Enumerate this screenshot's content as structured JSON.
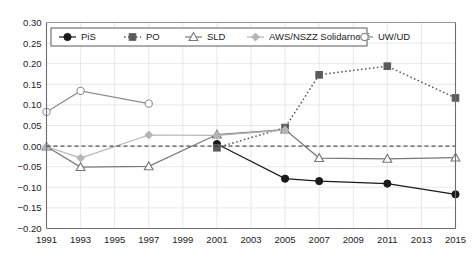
{
  "chart_data": {
    "type": "line",
    "title": "",
    "subtitle": "",
    "xlabel": "",
    "ylabel": "",
    "x": [
      1991,
      1993,
      1995,
      1997,
      1999,
      2001,
      2003,
      2005,
      2007,
      2009,
      2011,
      2013,
      2015
    ],
    "xlim": [
      1991,
      2015
    ],
    "ylim": [
      -0.2,
      0.3
    ],
    "ytick_labels": [
      "0.30",
      "0.25",
      "0.20",
      "0.15",
      "0.10",
      "0.05",
      "0.00",
      "-0.05",
      "-0.10",
      "-0.15",
      "-0.20"
    ],
    "ytick_values": [
      0.3,
      0.25,
      0.2,
      0.15,
      0.1,
      0.05,
      0.0,
      -0.05,
      -0.1,
      -0.15,
      -0.2
    ],
    "xtick_labels": [
      "1991",
      "1993",
      "1995",
      "1997",
      "1999",
      "2001",
      "2003",
      "2005",
      "2007",
      "2009",
      "2011",
      "2013",
      "2015"
    ],
    "grid": true,
    "legend_position": "top-inside",
    "reference_line": {
      "value": 0.0,
      "style": "dashed",
      "color": "#2a2a2a"
    },
    "series": [
      {
        "name": "PiS",
        "marker": "circle-filled",
        "line_style": "solid",
        "color": "#1a1a1a",
        "points": [
          {
            "x": 2001,
            "y": 0.005
          },
          {
            "x": 2005,
            "y": -0.079
          },
          {
            "x": 2007,
            "y": -0.085
          },
          {
            "x": 2011,
            "y": -0.091
          },
          {
            "x": 2015,
            "y": -0.117
          }
        ]
      },
      {
        "name": "PO",
        "marker": "square-filled",
        "line_style": "dotted",
        "color": "#5b5b5b",
        "points": [
          {
            "x": 2001,
            "y": -0.004
          },
          {
            "x": 2005,
            "y": 0.045
          },
          {
            "x": 2007,
            "y": 0.173
          },
          {
            "x": 2011,
            "y": 0.194
          },
          {
            "x": 2015,
            "y": 0.117
          }
        ]
      },
      {
        "name": "SLD",
        "marker": "triangle-open",
        "line_style": "solid",
        "color": "#777777",
        "points": [
          {
            "x": 1991,
            "y": -0.001
          },
          {
            "x": 1993,
            "y": -0.051
          },
          {
            "x": 1997,
            "y": -0.049
          },
          {
            "x": 2001,
            "y": 0.028
          },
          {
            "x": 2005,
            "y": 0.04
          },
          {
            "x": 2007,
            "y": -0.029
          },
          {
            "x": 2011,
            "y": -0.031
          },
          {
            "x": 2015,
            "y": -0.028
          }
        ]
      },
      {
        "name": "AWS/NSZZ Solidarność",
        "marker": "diamond-filled",
        "line_style": "solid",
        "color": "#b4b4b4",
        "points": [
          {
            "x": 1991,
            "y": -0.001
          },
          {
            "x": 1993,
            "y": -0.029
          },
          {
            "x": 1997,
            "y": 0.027
          },
          {
            "x": 2001,
            "y": 0.026
          },
          {
            "x": 2005,
            "y": 0.039
          }
        ]
      },
      {
        "name": "UW/UD",
        "marker": "circle-open",
        "line_style": "solid",
        "color": "#8d8d8d",
        "points": [
          {
            "x": 1991,
            "y": 0.083
          },
          {
            "x": 1993,
            "y": 0.134
          },
          {
            "x": 1997,
            "y": 0.103
          }
        ]
      }
    ]
  },
  "legend": {
    "items": [
      {
        "label": "PiS"
      },
      {
        "label": "PO"
      },
      {
        "label": "SLD"
      },
      {
        "label": "AWS/NSZZ Solidarność"
      },
      {
        "label": "UW/UD"
      }
    ]
  }
}
